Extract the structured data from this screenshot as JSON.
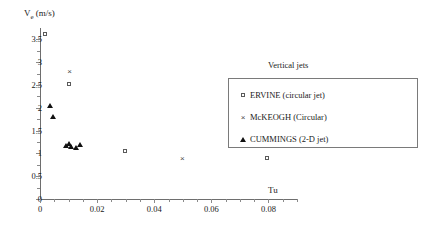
{
  "axes": {
    "y_title": "V",
    "y_title_sub": "e",
    "y_title_unit": " (m/s)",
    "x_title": "Tu",
    "y_ticks": [
      "0",
      "0.5",
      "1",
      "1.5",
      "2",
      "2.5",
      "3",
      "3.5"
    ],
    "x_ticks": [
      "0",
      "0.02",
      "0.04",
      "0.06",
      "0.08"
    ]
  },
  "legend": {
    "title": "Vertical jets",
    "entries": [
      {
        "symbol": "open-square",
        "label": "ERVINE (circular jet)",
        "glyph": ""
      },
      {
        "symbol": "cross",
        "label": "McKEOGH (Circular)",
        "glyph": "×"
      },
      {
        "symbol": "filled-triangle",
        "label": "CUMMINGS (2-D jet)",
        "glyph": ""
      }
    ]
  },
  "chart_data": {
    "type": "scatter",
    "title": "",
    "xlabel": "Tu",
    "ylabel": "Ve (m/s)",
    "xlim": [
      0,
      0.09
    ],
    "ylim": [
      0,
      3.75
    ],
    "xticks": [
      0,
      0.02,
      0.04,
      0.06,
      0.08
    ],
    "yticks": [
      0,
      0.5,
      1,
      1.5,
      2,
      2.5,
      3,
      3.5
    ],
    "x_minor_step": 0.005,
    "y_minor_step": 0.25,
    "grid": false,
    "legend_position": "right",
    "series": [
      {
        "name": "ERVINE (circular jet)",
        "marker": "open-square",
        "points": [
          {
            "x": 0.002,
            "y": 3.6
          },
          {
            "x": 0.0105,
            "y": 2.5
          },
          {
            "x": 0.03,
            "y": 1.03
          },
          {
            "x": 0.08,
            "y": 0.87
          }
        ]
      },
      {
        "name": "McKEOGH (Circular)",
        "marker": "cross",
        "points": [
          {
            "x": 0.0105,
            "y": 2.78
          },
          {
            "x": 0.05,
            "y": 0.87
          }
        ]
      },
      {
        "name": "CUMMINGS (2-D jet)",
        "marker": "filled-triangle",
        "points": [
          {
            "x": 0.0035,
            "y": 2.05
          },
          {
            "x": 0.0045,
            "y": 1.8
          },
          {
            "x": 0.009,
            "y": 1.16
          },
          {
            "x": 0.01,
            "y": 1.2
          },
          {
            "x": 0.011,
            "y": 1.13
          },
          {
            "x": 0.0125,
            "y": 1.12
          },
          {
            "x": 0.014,
            "y": 1.18
          }
        ]
      }
    ]
  }
}
